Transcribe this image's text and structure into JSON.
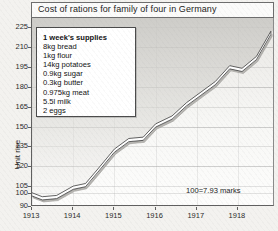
{
  "title": "Cost of rations for family of four in Germany",
  "ylabel": "Unit rise",
  "note": "100=7.93 marks",
  "legend": {
    "heading": "1 week's supplies",
    "items": [
      "8kg bread",
      "1kg flour",
      "14kg potatoes",
      "0.9kg sugar",
      "0.3kg butter",
      "0.975kg meat",
      "5.5l milk",
      "2 eggs"
    ]
  },
  "chart_data": {
    "type": "line",
    "title": "Cost of rations for family of four in Germany",
    "xlabel": "",
    "ylabel": "Unit rise",
    "annotation": "100=7.93 marks",
    "grid": true,
    "legend_position": "inside-top-left",
    "ylim": [
      90,
      232
    ],
    "xlim": [
      1913,
      1918.9
    ],
    "ytick_labels": [
      "225",
      "210",
      "195",
      "180",
      "165",
      "150",
      "135",
      "120",
      "105",
      "100",
      "90"
    ],
    "ytick_values": [
      225,
      210,
      195,
      180,
      165,
      150,
      135,
      120,
      105,
      100,
      90
    ],
    "xtick_labels": [
      "1913",
      "1914",
      "1915",
      "1916",
      "1917",
      "1918"
    ],
    "xtick_values": [
      1913,
      1914,
      1915,
      1916,
      1917,
      1918
    ],
    "series": [
      {
        "name": "Cost of rations index",
        "x": [
          1913.0,
          1913.25,
          1913.6,
          1914.0,
          1914.3,
          1914.6,
          1915.0,
          1915.35,
          1915.7,
          1916.0,
          1916.4,
          1916.75,
          1917.1,
          1917.45,
          1917.8,
          1918.1,
          1918.45,
          1918.8
        ],
        "values": [
          100,
          97,
          98,
          105,
          107,
          118,
          133,
          141,
          142,
          152,
          158,
          168,
          176,
          184,
          196,
          194,
          203,
          222
        ]
      }
    ]
  }
}
